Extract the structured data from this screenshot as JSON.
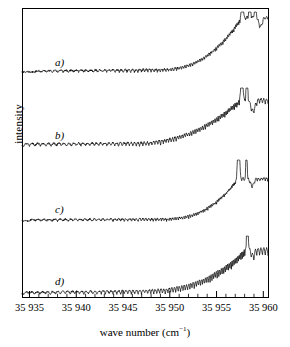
{
  "figure": {
    "kind": "spectrum-stack",
    "background": "#ffffff",
    "ink": "#000000",
    "frame": {
      "x": 22,
      "y": 8,
      "width": 246,
      "height": 289,
      "stroke_width": 1
    }
  },
  "axes": {
    "y": {
      "label": "intensity",
      "ticks": [],
      "tick_labels": []
    },
    "x": {
      "label_text": "wave number (cm",
      "label_sup": "−1",
      "label_tail": ")",
      "label_full": "wave number (cm⁻¹)",
      "unit": "cm^-1",
      "min": 35934.2,
      "max": 35960.5,
      "major_step": 5,
      "minor_step": 1,
      "major_ticks": [
        35935,
        35940,
        35945,
        35950,
        35955,
        35960
      ],
      "major_tick_labels": [
        "35 935",
        "35 940",
        "35 945",
        "35 950",
        "35 955",
        "35 960"
      ],
      "major_tick_len": 6,
      "minor_tick_len": 3.2
    }
  },
  "chart_data": {
    "type": "line",
    "title": "",
    "xlabel": "wave number (cm⁻¹)",
    "ylabel": "intensity",
    "xlim": [
      35934.2,
      35960.5
    ],
    "ylim": [
      0,
      1
    ],
    "grid": false,
    "legend": "none",
    "n_points": 900,
    "series": [
      {
        "name": "a",
        "label": "a)",
        "label_x": 55,
        "label_y": 56,
        "baseline_y": 72,
        "plot_top_y": 12,
        "noise_amp": 0.9,
        "osc": {
          "start": 35935.6,
          "amp_start": 1.2,
          "amp_mid": 2.6,
          "amp_end": 3.4,
          "period_start": 0.62,
          "period_end": 0.3
        },
        "rise": {
          "onset": 35948.6,
          "power": 2.5,
          "height": 52.0,
          "convergence": 35957.7
        },
        "peaks": [
          {
            "center": 35957.75,
            "height": 62.0,
            "width": 0.1
          },
          {
            "center": 35958.55,
            "height": 58.0,
            "width": 0.09
          },
          {
            "center": 35959.15,
            "height": 30.0,
            "width": 0.1
          }
        ],
        "dip": {
          "center": 35959.7,
          "depth": 9.0,
          "width": 0.25
        }
      },
      {
        "name": "b",
        "label": "b)",
        "label_x": 55,
        "label_y": 129,
        "baseline_y": 146,
        "plot_top_y": 88,
        "noise_amp": 0.9,
        "osc": {
          "start": 35934.4,
          "amp_start": 2.4,
          "amp_mid": 3.4,
          "amp_end": 5.2,
          "period_start": 0.6,
          "period_end": 0.3
        },
        "rise": {
          "onset": 35946.5,
          "power": 2.2,
          "height": 42.0,
          "convergence": 35957.6
        },
        "peaks": [
          {
            "center": 35957.7,
            "height": 55.0,
            "width": 0.12
          },
          {
            "center": 35958.25,
            "height": 62.0,
            "width": 0.09
          }
        ],
        "dip": {
          "center": 35958.9,
          "depth": 11.0,
          "width": 0.3
        }
      },
      {
        "name": "c",
        "label": "c)",
        "label_x": 55,
        "label_y": 203,
        "baseline_y": 221,
        "plot_top_y": 160,
        "noise_amp": 0.8,
        "osc": {
          "start": 35935.0,
          "amp_start": 1.6,
          "amp_mid": 2.2,
          "amp_end": 3.0,
          "period_start": 0.62,
          "period_end": 0.28
        },
        "rise": {
          "onset": 35949.0,
          "power": 2.6,
          "height": 40.0,
          "convergence": 35957.3
        },
        "peaks": [
          {
            "center": 35957.35,
            "height": 47.0,
            "width": 0.14
          },
          {
            "center": 35958.2,
            "height": 64.0,
            "width": 0.07
          }
        ],
        "dip": {
          "center": 35958.8,
          "depth": 7.0,
          "width": 0.26
        }
      },
      {
        "name": "d",
        "label": "d)",
        "label_x": 55,
        "label_y": 275,
        "baseline_y": 294,
        "plot_top_y": 236,
        "noise_amp": 0.8,
        "osc": {
          "start": 35934.4,
          "amp_start": 2.0,
          "amp_mid": 3.6,
          "amp_end": 8.0,
          "period_start": 0.58,
          "period_end": 0.3
        },
        "rise": {
          "onset": 35948.0,
          "power": 2.4,
          "height": 38.0,
          "convergence": 35958.2
        },
        "peaks": [
          {
            "center": 35958.3,
            "height": 56.0,
            "width": 0.1
          }
        ],
        "dip": {
          "center": 35958.9,
          "depth": 6.0,
          "width": 0.22
        }
      }
    ]
  }
}
